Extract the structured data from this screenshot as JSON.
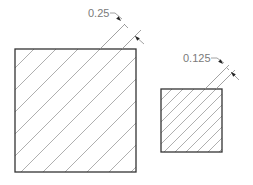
{
  "diagram": {
    "type": "hatch-spacing-illustration",
    "colors": {
      "background": "#ffffff",
      "outline": "#333333",
      "hatch": "#9a9a9a",
      "dimension_line": "#8a8a8a",
      "arrow": "#222222",
      "label": "#7a7a7a"
    },
    "shapes": [
      {
        "id": "large-square",
        "rect": {
          "x": 15,
          "y": 49,
          "width": 121,
          "height": 123
        },
        "hatch": {
          "angle_deg": 45,
          "spacing_px": 22,
          "offset_c": 83
        },
        "dimension": {
          "label": "0.25",
          "label_pos": {
            "x": 88,
            "y": 17
          },
          "leader": [
            [
              110,
              13
            ],
            [
              115,
              13
            ],
            [
              122,
              19
            ]
          ],
          "extension_lines": [
            [
              [
                100,
                49
              ],
              [
                125,
                24
              ]
            ],
            [
              [
                122,
                49
              ],
              [
                141,
                30
              ]
            ]
          ],
          "arrows": [
            {
              "tip": [
                121,
                21
              ],
              "dir": [
                1,
                1
              ]
            },
            {
              "tip": [
                135,
                36
              ],
              "dir": [
                -1,
                -1
              ]
            }
          ],
          "arrow_tails": [
            [
              [
                124,
                24
              ],
              [
                128,
                28
              ]
            ],
            [
              [
                135,
                36
              ],
              [
                144,
                44
              ]
            ]
          ]
        }
      },
      {
        "id": "small-square",
        "rect": {
          "x": 161,
          "y": 89,
          "width": 61,
          "height": 63
        },
        "hatch": {
          "angle_deg": 45,
          "spacing_px": 11,
          "offset_c": 261
        },
        "dimension": {
          "label": "0.125",
          "label_pos": {
            "x": 183,
            "y": 62
          },
          "leader": [
            [
              211,
              58
            ],
            [
              217,
              58
            ],
            [
              224,
              63
            ]
          ],
          "extension_lines": [
            [
              [
                205,
                89
              ],
              [
                229,
                65
              ]
            ],
            [
              [
                216,
                89
              ],
              [
                235,
                70
              ]
            ]
          ],
          "arrows": [
            {
              "tip": [
                223,
                64
              ],
              "dir": [
                1,
                1
              ]
            },
            {
              "tip": [
                231,
                72
              ],
              "dir": [
                -1,
                -1
              ]
            }
          ],
          "arrow_tails": [
            [
              [
                227,
                68
              ],
              [
                229,
                70
              ]
            ],
            [
              [
                231,
                72
              ],
              [
                239,
                80
              ]
            ]
          ]
        }
      }
    ]
  }
}
